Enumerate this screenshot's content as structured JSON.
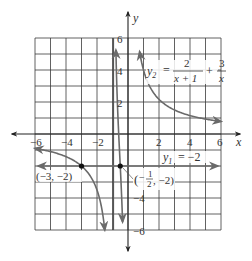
{
  "chart_data": {
    "type": "line",
    "title": "",
    "xlabel": "x",
    "ylabel": "y",
    "xlim": [
      -6,
      6
    ],
    "ylim": [
      -6,
      6
    ],
    "grid": true,
    "grid_step": 1,
    "x_ticks": [
      -6,
      -4,
      -2,
      2,
      4,
      6
    ],
    "x_tick_labels": [
      "−6",
      "−4",
      "−2",
      "2",
      "4",
      "6"
    ],
    "y_ticks": [
      6,
      4,
      2,
      -4,
      -6
    ],
    "y_tick_labels": [
      "6",
      "4",
      "2",
      "−4",
      "−6"
    ],
    "series": [
      {
        "name": "y1 = -2",
        "label_parts": {
          "lhs": "y",
          "sub": "1",
          "rhs": "= −2"
        },
        "type": "horizontal_line",
        "y": -2,
        "x_range": [
          -5.8,
          5.8
        ]
      },
      {
        "name": "y2 = 2/(x+1) + 3/x",
        "label_parts": {
          "lhs": "y",
          "sub": "2",
          "eq": "=",
          "num1": "2",
          "den1": "x + 1",
          "plus": "+",
          "num2": "3",
          "den2": "x"
        },
        "type": "function",
        "asymptotes_x": [
          -1,
          0
        ],
        "branches": [
          {
            "x_range": [
              -6,
              -1.5
            ]
          },
          {
            "x_range": [
              -0.78,
              -0.35
            ]
          },
          {
            "x_range": [
              0.75,
              6
            ]
          }
        ]
      }
    ],
    "points": [
      {
        "x": -3,
        "y": -2,
        "label": "(−3, −2)"
      },
      {
        "x": -0.5,
        "y": -2,
        "label_open": "(",
        "label_num": "1",
        "label_den": "2",
        "label_rest": ", −2)",
        "label_sign": "−"
      }
    ]
  }
}
